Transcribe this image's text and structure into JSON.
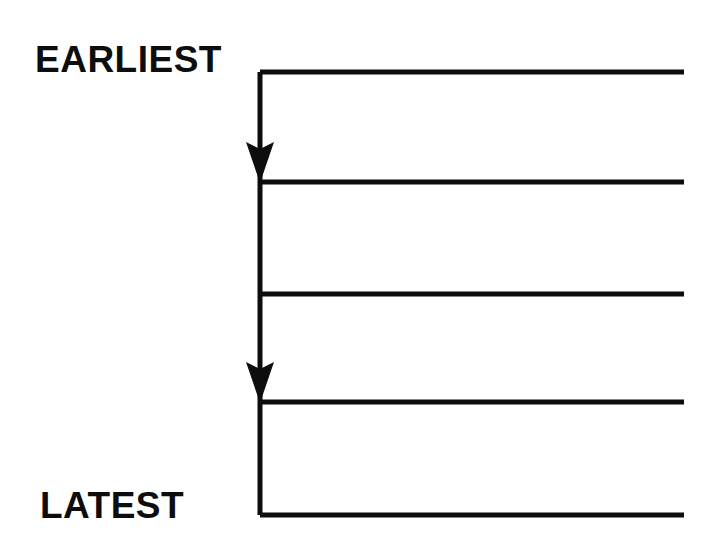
{
  "diagram": {
    "type": "timeline-flow",
    "background_color": "#ffffff",
    "ink_color": "#0d0d0d",
    "labels": {
      "earliest": "EARLIEST",
      "latest": "LATEST"
    },
    "label_positions": {
      "earliest": {
        "x": 35,
        "y": 72,
        "anchor": "start"
      },
      "latest": {
        "x": 40,
        "y": 518,
        "anchor": "start"
      }
    },
    "axis": {
      "name": "time-axis",
      "orientation": "vertical",
      "direction": "downward",
      "x": 260,
      "y_start": 72,
      "y_end": 515,
      "stroke_width": 5
    },
    "rules": [
      {
        "id": "rule-1",
        "index": 1,
        "y": 72,
        "x_start": 260,
        "x_end": 684,
        "stroke_width": 5
      },
      {
        "id": "rule-2",
        "index": 2,
        "y": 182,
        "x_start": 260,
        "x_end": 684,
        "stroke_width": 5
      },
      {
        "id": "rule-3",
        "index": 3,
        "y": 294,
        "x_start": 260,
        "x_end": 684,
        "stroke_width": 5
      },
      {
        "id": "rule-4",
        "index": 4,
        "y": 402,
        "x_start": 260,
        "x_end": 684,
        "stroke_width": 5
      },
      {
        "id": "rule-5",
        "index": 5,
        "y": 515,
        "x_start": 260,
        "x_end": 684,
        "stroke_width": 5
      }
    ],
    "arrowheads": [
      {
        "id": "arrowhead-1",
        "index": 1,
        "tip_x": 260,
        "tip_y": 182,
        "width": 28,
        "height": 40,
        "direction": "down"
      },
      {
        "id": "arrowhead-2",
        "index": 2,
        "tip_x": 260,
        "tip_y": 402,
        "width": 28,
        "height": 40,
        "direction": "down"
      }
    ]
  },
  "chart_data": {
    "type": "diagram",
    "xlabel": "",
    "ylabel": "Time",
    "grid": false,
    "legend": null,
    "annotations": [
      "EARLIEST",
      "LATEST"
    ],
    "categories": [
      "EARLIEST",
      "LATEST"
    ],
    "values": [
      72,
      515
    ]
  }
}
